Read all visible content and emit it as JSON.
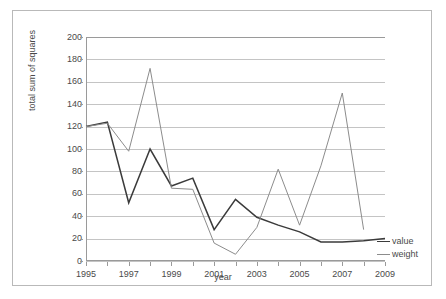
{
  "chart_data": {
    "type": "line",
    "title": "",
    "xlabel": "year",
    "ylabel": "total sum of squares",
    "xlim": [
      1995,
      2009
    ],
    "ylim": [
      0,
      200
    ],
    "ytick_step": 20,
    "grid": "horizontal",
    "legend_position": "right-inline",
    "x": [
      1995,
      1996,
      1997,
      1998,
      1999,
      2000,
      2001,
      2002,
      2003,
      2004,
      2005,
      2006,
      2007,
      2008,
      2009
    ],
    "xtick_labels": [
      "1995",
      "1997",
      "1999",
      "2001",
      "2003",
      "2005",
      "2007",
      "2009"
    ],
    "ytick_labels": [
      "0",
      "20",
      "40",
      "60",
      "80",
      "100",
      "120",
      "140",
      "160",
      "180",
      "200"
    ],
    "series": [
      {
        "name": "value",
        "color": "#3b3b3b",
        "values": [
          120,
          124,
          52,
          100,
          67,
          74,
          28,
          55,
          39,
          32,
          26,
          17,
          17,
          18,
          20
        ]
      },
      {
        "name": "weight",
        "color": "#8c8c8c",
        "values": [
          120,
          123,
          98,
          172,
          65,
          64,
          16,
          6,
          30,
          82,
          32,
          85,
          150,
          28,
          null
        ]
      }
    ]
  },
  "legend": {
    "entries": [
      {
        "label": "value"
      },
      {
        "label": "weight"
      }
    ]
  },
  "axes": {
    "y_title": "total sum of squares",
    "x_title": "year"
  },
  "colors": {
    "value_series": "#3b3b3b",
    "weight_series": "#8c8c8c",
    "gridline": "#c4c4c4",
    "axis": "#9a9a9a",
    "frame": "#b9b9b9",
    "text": "#4a4a4a",
    "background": "#ffffff"
  }
}
